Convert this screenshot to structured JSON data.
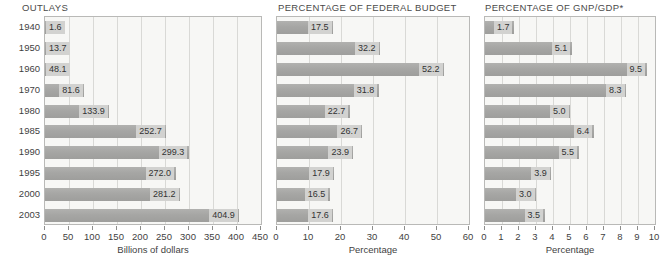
{
  "chart_data": [
    {
      "type": "bar",
      "orientation": "horizontal",
      "title": "OUTLAYS",
      "xlabel": "Billions of dollars",
      "ylabel": "",
      "xlim": [
        0,
        450
      ],
      "xticks": [
        0,
        50,
        100,
        150,
        200,
        250,
        300,
        350,
        400,
        450
      ],
      "grid": true,
      "legend": "none",
      "categories": [
        "1940",
        "1950",
        "1960",
        "1970",
        "1980",
        "1985",
        "1990",
        "1995",
        "2000",
        "2003"
      ],
      "values": [
        1.6,
        13.7,
        48.1,
        81.6,
        133.9,
        252.7,
        299.3,
        272.0,
        281.2,
        404.9
      ],
      "value_labels": [
        "1.6",
        "13.7",
        "48.1",
        "81.6",
        "133.9",
        "252.7",
        "299.3",
        "272.0",
        "281.2",
        "404.9"
      ]
    },
    {
      "type": "bar",
      "orientation": "horizontal",
      "title": "PERCENTAGE OF FEDERAL BUDGET",
      "xlabel": "Percentage",
      "ylabel": "",
      "xlim": [
        0,
        60
      ],
      "xticks": [
        0,
        10,
        20,
        30,
        40,
        50,
        60
      ],
      "grid": true,
      "legend": "none",
      "categories": [
        "1940",
        "1950",
        "1960",
        "1970",
        "1980",
        "1985",
        "1990",
        "1995",
        "2000",
        "2003"
      ],
      "values": [
        17.5,
        32.2,
        52.2,
        31.8,
        22.7,
        26.7,
        23.9,
        17.9,
        16.5,
        17.6
      ],
      "value_labels": [
        "17.5",
        "32.2",
        "52.2",
        "31.8",
        "22.7",
        "26.7",
        "23.9",
        "17.9",
        "16.5",
        "17.6"
      ]
    },
    {
      "type": "bar",
      "orientation": "horizontal",
      "title": "PERCENTAGE OF GNP/GDP*",
      "xlabel": "Percentage",
      "ylabel": "",
      "xlim": [
        0,
        10
      ],
      "xticks": [
        0,
        1,
        2,
        3,
        4,
        5,
        6,
        7,
        8,
        9,
        10
      ],
      "grid": true,
      "legend": "none",
      "categories": [
        "1940",
        "1950",
        "1960",
        "1970",
        "1980",
        "1985",
        "1990",
        "1995",
        "2000",
        "2003"
      ],
      "values": [
        1.7,
        5.1,
        9.5,
        8.3,
        5.0,
        6.4,
        5.5,
        3.9,
        3.0,
        3.5
      ],
      "value_labels": [
        "1.7",
        "5.1",
        "9.5",
        "8.3",
        "5.0",
        "6.4",
        "5.5",
        "3.9",
        "3.0",
        "3.5"
      ]
    }
  ],
  "colors": {
    "bar": "#a9a9a7",
    "bar_label_bg": "#d2d2d0",
    "plot_bg": "#f7f7f5",
    "grid": "#d9d9d6",
    "border": "#b9b9b7",
    "text": "#3f3f3f"
  }
}
